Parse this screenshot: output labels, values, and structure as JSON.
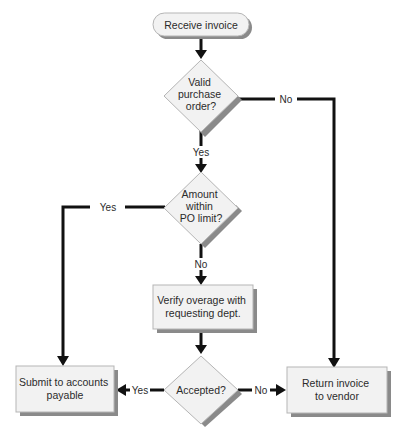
{
  "diagram": {
    "type": "flowchart",
    "nodes": {
      "start": {
        "shape": "terminator",
        "label": "Receive invoice"
      },
      "valid_po": {
        "shape": "decision",
        "lines": [
          "Valid",
          "purchase",
          "order?"
        ]
      },
      "within_limit": {
        "shape": "decision",
        "lines": [
          "Amount",
          "within",
          "PO limit?"
        ]
      },
      "verify": {
        "shape": "process",
        "lines": [
          "Verify overage with",
          "requesting dept."
        ]
      },
      "accepted": {
        "shape": "decision",
        "lines": [
          "Accepted?"
        ]
      },
      "submit": {
        "shape": "process",
        "lines": [
          "Submit to accounts",
          "payable"
        ]
      },
      "return": {
        "shape": "process",
        "lines": [
          "Return invoice",
          "to vendor"
        ]
      }
    },
    "edges": {
      "valid_yes": "Yes",
      "valid_no": "No",
      "limit_yes": "Yes",
      "limit_no": "No",
      "accepted_yes": "Yes",
      "accepted_no": "No"
    },
    "colors": {
      "node_fill": "#f2f2f2",
      "node_border": "#b5b5b5",
      "shadow": "#8a8a8a",
      "line": "#111111",
      "text": "#2b2b2b"
    }
  }
}
